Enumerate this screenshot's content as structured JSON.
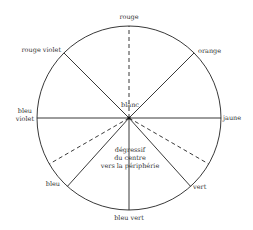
{
  "diagram": {
    "type": "color-wheel",
    "center_label": "blanc",
    "inner_note_lines": [
      "dégressif",
      "du centre",
      "vers la périphérie"
    ],
    "spokes": [
      {
        "id": "rouge",
        "label": "rouge",
        "angle_deg": 90,
        "style": "dashed"
      },
      {
        "id": "orange",
        "label": "orange",
        "angle_deg": 45,
        "style": "solid"
      },
      {
        "id": "jaune",
        "label": "jaune",
        "angle_deg": 0,
        "style": "solid"
      },
      {
        "id": "vert-dash",
        "label": "",
        "angle_deg": -30,
        "style": "dashed"
      },
      {
        "id": "vert",
        "label": "vert",
        "angle_deg": -48,
        "style": "solid"
      },
      {
        "id": "bleu-vert",
        "label": "bleu vert",
        "angle_deg": -90,
        "style": "solid"
      },
      {
        "id": "bleu",
        "label": "bleu",
        "angle_deg": -132,
        "style": "solid"
      },
      {
        "id": "bleu-dash",
        "label": "",
        "angle_deg": -150,
        "style": "dashed"
      },
      {
        "id": "bleu-violet",
        "label_lines": [
          "bleu",
          "violet"
        ],
        "angle_deg": 180,
        "style": "solid"
      },
      {
        "id": "rouge-violet",
        "label": "rouge violet",
        "angle_deg": 135,
        "style": "solid"
      }
    ]
  },
  "labels": {
    "rouge": "rouge",
    "orange": "orange",
    "jaune": "jaune",
    "vert": "vert",
    "bleu_vert": "bleu vert",
    "bleu": "bleu",
    "bleu_violet_1": "bleu",
    "bleu_violet_2": "violet",
    "rouge_violet": "rouge violet",
    "blanc": "blanc",
    "note_1": "dégressif",
    "note_2": "du centre",
    "note_3": "vers la périphérie"
  }
}
